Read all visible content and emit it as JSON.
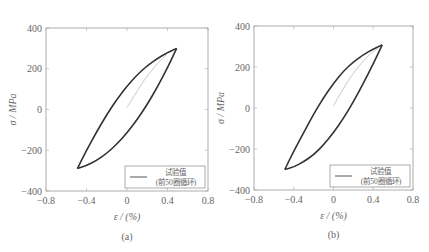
{
  "chart_data": [
    {
      "type": "line",
      "panel_label": "(a)",
      "title": "",
      "xlabel": "ε / (%)",
      "ylabel": "σ / MPa",
      "xlim": [
        -0.8,
        0.8
      ],
      "ylim": [
        -400,
        400
      ],
      "xticks": [
        -0.8,
        -0.4,
        0,
        0.4,
        0.8
      ],
      "xtick_labels": [
        "−0.8",
        "−0.4",
        "0",
        "0.4",
        "0.8"
      ],
      "yticks": [
        400,
        200,
        0,
        -200,
        -400
      ],
      "ytick_labels": [
        "400",
        "200",
        "0",
        "−200",
        "−400"
      ],
      "grid": false,
      "legend": {
        "position": "lower right",
        "entries": [
          "试验值",
          "(前50圈循环)"
        ]
      },
      "series": [
        {
          "name": "hysteresis-loop-upper",
          "x": [
            -0.49,
            -0.4,
            -0.3,
            -0.2,
            -0.1,
            0.0,
            0.1,
            0.2,
            0.3,
            0.4,
            0.49
          ],
          "y": [
            -290,
            -200,
            -110,
            -25,
            50,
            115,
            170,
            215,
            250,
            280,
            300
          ]
        },
        {
          "name": "hysteresis-loop-lower",
          "x": [
            0.49,
            0.4,
            0.3,
            0.2,
            0.1,
            0.0,
            -0.1,
            -0.2,
            -0.3,
            -0.4,
            -0.49
          ],
          "y": [
            300,
            205,
            110,
            25,
            -50,
            -115,
            -170,
            -215,
            -250,
            -275,
            -290
          ]
        },
        {
          "name": "initial-loading",
          "x": [
            0.0,
            0.05,
            0.1,
            0.15,
            0.2,
            0.25,
            0.3,
            0.35,
            0.4
          ],
          "y": [
            10,
            50,
            90,
            130,
            165,
            195,
            225,
            250,
            275
          ]
        }
      ]
    },
    {
      "type": "line",
      "panel_label": "(b)",
      "title": "",
      "xlabel": "ε / (%)",
      "ylabel": "σ / MPa",
      "xlim": [
        -0.8,
        0.8
      ],
      "ylim": [
        -400,
        400
      ],
      "xticks": [
        -0.8,
        -0.4,
        0,
        0.4,
        0.8
      ],
      "xtick_labels": [
        "−0.8",
        "−0.4",
        "0",
        "0.4",
        "0.8"
      ],
      "yticks": [
        400,
        200,
        0,
        -200,
        -400
      ],
      "ytick_labels": [
        "400",
        "200",
        "0",
        "−200",
        "−400"
      ],
      "grid": false,
      "legend": {
        "position": "lower right",
        "entries": [
          "试验值",
          "(前50圈循环)"
        ]
      },
      "series": [
        {
          "name": "hysteresis-loop-upper",
          "x": [
            -0.49,
            -0.4,
            -0.3,
            -0.2,
            -0.1,
            0.0,
            0.1,
            0.2,
            0.3,
            0.4,
            0.49
          ],
          "y": [
            -300,
            -210,
            -120,
            -30,
            50,
            120,
            180,
            225,
            260,
            288,
            308
          ]
        },
        {
          "name": "hysteresis-loop-lower",
          "x": [
            0.49,
            0.4,
            0.3,
            0.2,
            0.1,
            0.0,
            -0.1,
            -0.2,
            -0.3,
            -0.4,
            -0.49
          ],
          "y": [
            308,
            215,
            120,
            30,
            -50,
            -120,
            -180,
            -228,
            -262,
            -288,
            -300
          ]
        },
        {
          "name": "initial-loading",
          "x": [
            0.0,
            0.05,
            0.1,
            0.15,
            0.2,
            0.25,
            0.3,
            0.35,
            0.4,
            0.45
          ],
          "y": [
            10,
            55,
            95,
            135,
            170,
            200,
            230,
            255,
            275,
            292
          ]
        }
      ]
    }
  ],
  "panels": [
    {
      "label": "(a)"
    },
    {
      "label": "(b)"
    }
  ]
}
